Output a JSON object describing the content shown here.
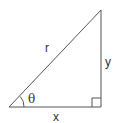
{
  "diagram": {
    "type": "right-triangle",
    "stroke_color": "#555555",
    "labels": {
      "hypotenuse": "r",
      "opposite": "y",
      "adjacent": "x",
      "angle": "θ"
    },
    "vertices": {
      "origin": [
        9,
        107
      ],
      "right_angle": [
        101,
        107
      ],
      "top": [
        101,
        10
      ]
    }
  }
}
